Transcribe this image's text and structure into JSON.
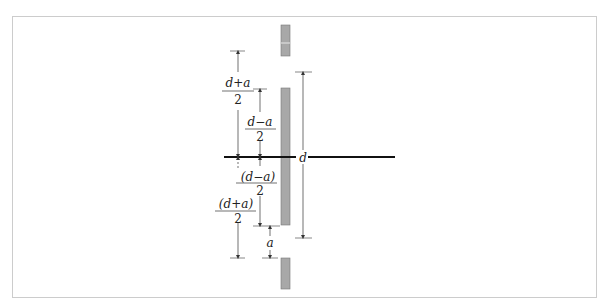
{
  "diagram": {
    "labels": {
      "d_plus_a_top_num": "d+a",
      "d_plus_a_top_den": "2",
      "d_minus_a_top_num": "d−a",
      "d_minus_a_top_den": "2",
      "d_label": "d",
      "d_minus_a_bottom_num": "(d−a)",
      "d_minus_a_bottom_den": "2",
      "d_plus_a_bottom_num": "(d+a)",
      "d_plus_a_bottom_den": "2",
      "a_label": "a"
    },
    "colors": {
      "slab_fill": "#a8a8a8",
      "slab_stroke": "#777777",
      "axis": "#111111",
      "frame": "#cccccc",
      "dim_line": "#333333"
    }
  }
}
